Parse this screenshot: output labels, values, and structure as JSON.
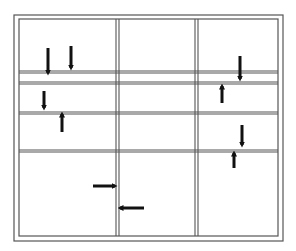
{
  "diagram": {
    "title": "",
    "line_color": "#555555",
    "arrow_color": "#111111",
    "background": "#ffffff",
    "outer_frame": {
      "x1": 14,
      "y1": 15,
      "x2": 283,
      "y2": 241
    },
    "inner_frame": {
      "x1": 19,
      "y1": 19,
      "x2": 278,
      "y2": 236
    },
    "vertical_dividers": [
      {
        "name": "divider-left",
        "x_pair": [
          116,
          119
        ]
      },
      {
        "name": "divider-right",
        "x_pair": [
          195,
          198
        ]
      }
    ],
    "horizontal_dividers": [
      {
        "name": "divider-1",
        "y_pair": [
          71,
          73
        ]
      },
      {
        "name": "divider-2",
        "y_pair": [
          82,
          84
        ]
      },
      {
        "name": "divider-3",
        "y_pair": [
          112,
          114
        ]
      },
      {
        "name": "divider-4",
        "y_pair": [
          150,
          152
        ]
      }
    ],
    "arrows": [
      {
        "name": "arrow-down-1",
        "direction": "down",
        "x": 48,
        "y_from": 48,
        "y_to": 73
      },
      {
        "name": "arrow-down-2",
        "direction": "down",
        "x": 71,
        "y_from": 46,
        "y_to": 68
      },
      {
        "name": "arrow-down-3",
        "direction": "down",
        "x": 44,
        "y_from": 91,
        "y_to": 108
      },
      {
        "name": "arrow-up-1",
        "direction": "up",
        "x": 62,
        "y_from": 132,
        "y_to": 114
      },
      {
        "name": "arrow-down-4",
        "direction": "down",
        "x": 240,
        "y_from": 56,
        "y_to": 79
      },
      {
        "name": "arrow-up-2",
        "direction": "up",
        "x": 222,
        "y_from": 103,
        "y_to": 86
      },
      {
        "name": "arrow-down-5",
        "direction": "down",
        "x": 242,
        "y_from": 125,
        "y_to": 145
      },
      {
        "name": "arrow-up-3",
        "direction": "up",
        "x": 234,
        "y_from": 168,
        "y_to": 153
      },
      {
        "name": "arrow-right-1",
        "direction": "right",
        "y": 186,
        "x_from": 93,
        "x_to": 115
      },
      {
        "name": "arrow-left-1",
        "direction": "left",
        "y": 208,
        "x_from": 144,
        "x_to": 120
      }
    ]
  }
}
